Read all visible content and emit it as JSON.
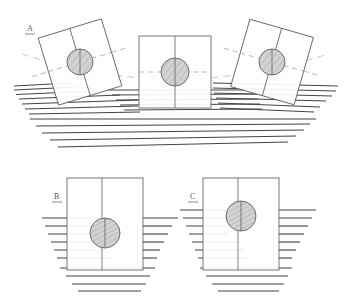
{
  "figure": {
    "type": "technical-diagram",
    "background_color": "#ffffff",
    "line_color": "#4a4f55",
    "hatch_color": "#3a3f45",
    "circle_fill": "#d2d2d2",
    "circle_stroke": "#5a5f65",
    "construction_line_color": "#9aa0a6"
  },
  "panels": [
    {
      "id": "A",
      "label": "A",
      "caption_position": "upper-left",
      "blocks": [
        {
          "name": "left-block",
          "rotation_deg": -17,
          "cx": 80,
          "cy": 62,
          "w": 66,
          "h": 70,
          "circle_r": 13,
          "circle_offset_y": 0
        },
        {
          "name": "center-block",
          "rotation_deg": 0,
          "cx": 175,
          "cy": 72,
          "w": 72,
          "h": 72,
          "circle_r": 14,
          "circle_offset_y": 0
        },
        {
          "name": "right-block",
          "rotation_deg": 16,
          "cx": 272,
          "cy": 62,
          "w": 66,
          "h": 70,
          "circle_r": 13,
          "circle_offset_y": 0
        }
      ],
      "waterline_count": 11,
      "arc_guide": true
    },
    {
      "id": "B",
      "label": "B",
      "caption_position": "left",
      "block": {
        "x": 67,
        "y": 178,
        "w": 76,
        "h": 92,
        "divider_x_ratio": 0.46
      },
      "circle": {
        "cx": 105,
        "cy": 233,
        "r": 15
      },
      "waterline_count": 10
    },
    {
      "id": "C",
      "label": "C",
      "caption_position": "left",
      "block": {
        "x": 203,
        "y": 178,
        "w": 76,
        "h": 92,
        "divider_x_ratio": 0.46
      },
      "circle": {
        "cx": 241,
        "cy": 216,
        "r": 15
      },
      "waterline_count": 10
    }
  ],
  "labels": {
    "a": "A",
    "b": "B",
    "c": "C"
  }
}
